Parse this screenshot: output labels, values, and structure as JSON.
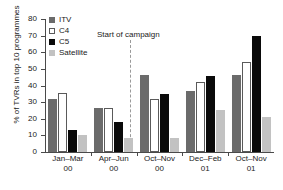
{
  "chart_data": {
    "type": "bar",
    "title": "",
    "xlabel": "",
    "ylabel": "% of TVRs in top 10 programmes",
    "ylim": [
      0,
      80
    ],
    "yticks": [
      0,
      10,
      20,
      30,
      40,
      50,
      60,
      70,
      80
    ],
    "grid": false,
    "legend_position": "top-left",
    "categories": [
      "Jan–Mar 00",
      "Apr–Jun 00",
      "Oct–Nov 00",
      "Dec–Feb 01",
      "Oct–Nov 01"
    ],
    "category_lines": [
      {
        "period": "Jan–Mar",
        "year": "00"
      },
      {
        "period": "Apr–Jun",
        "year": "00"
      },
      {
        "period": "Oct–Nov",
        "year": "00"
      },
      {
        "period": "Dec–Feb",
        "year": "01"
      },
      {
        "period": "Oct–Nov",
        "year": "01"
      }
    ],
    "series": [
      {
        "name": "ITV",
        "color": "#6b6b6b",
        "values": [
          32.0,
          26.5,
          46.5,
          37.0,
          46.5
        ]
      },
      {
        "name": "C4",
        "color": "#ffffff",
        "values": [
          35.5,
          26.5,
          32.0,
          42.0,
          54.0
        ]
      },
      {
        "name": "C5",
        "color": "#0a0a0a",
        "values": [
          13.0,
          18.0,
          35.0,
          46.0,
          69.5
        ]
      },
      {
        "name": "Satellite",
        "color": "#c2c2c2",
        "values": [
          10.5,
          8.5,
          8.5,
          25.0,
          21.0
        ]
      }
    ],
    "annotations": [
      {
        "text": "Start of campaign",
        "type": "vertical-dashed-line",
        "after_category": "Apr–Jun 00"
      }
    ]
  },
  "legend": {
    "items": [
      {
        "label": "ITV"
      },
      {
        "label": "C4"
      },
      {
        "label": "C5"
      },
      {
        "label": "Satellite"
      }
    ]
  },
  "annotation": {
    "campaign_label": "Start of campaign"
  }
}
